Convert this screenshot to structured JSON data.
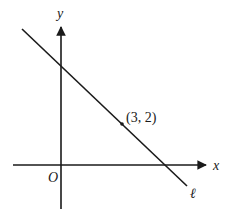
{
  "diagram": {
    "type": "coordinate-plane",
    "axes": {
      "x_label": "x",
      "y_label": "y",
      "origin_label": "O"
    },
    "line": {
      "label": "ℓ",
      "slope_sign": "negative"
    },
    "point": {
      "label": "(3, 2)",
      "x": 3,
      "y": 2
    },
    "colors": {
      "stroke": "#1a1a1a",
      "background": "#ffffff"
    }
  }
}
